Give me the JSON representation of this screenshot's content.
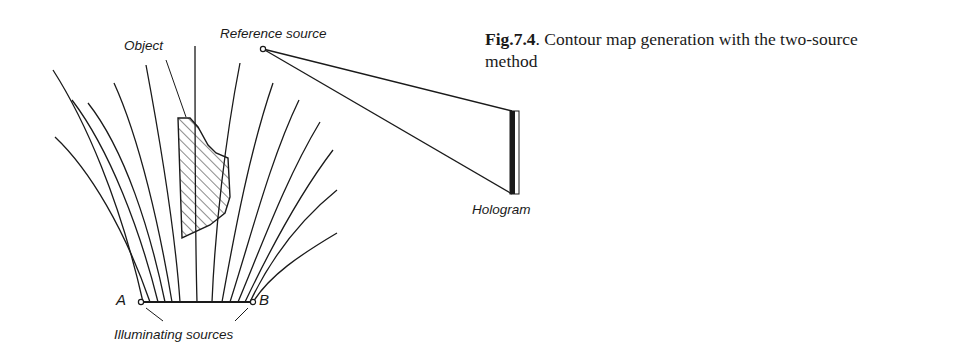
{
  "figure": {
    "caption": {
      "number": "Fig.7.4",
      "text": ". Contour map generation with the two-source method"
    },
    "labels": {
      "object": "Object",
      "reference_source": "Reference source",
      "hologram": "Hologram",
      "source_a": "A",
      "source_b": "B",
      "illuminating_sources": "Illuminating sources"
    },
    "elements": {
      "reference_source_point": [
        263,
        49
      ],
      "source_a_point": [
        141,
        302
      ],
      "source_b_point": [
        253,
        302
      ],
      "hologram_plate": {
        "x": 510,
        "y": 111,
        "width": 9,
        "height": 83
      },
      "contour_line_count": 17
    },
    "colors": {
      "ink": "#1a1a1a",
      "background": "#ffffff"
    }
  }
}
